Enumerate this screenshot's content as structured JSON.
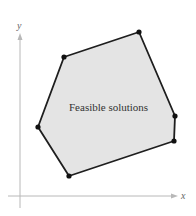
{
  "diagram": {
    "type": "feasible-region",
    "region_label": "Feasible solutions",
    "axes": {
      "x_label": "x",
      "y_label": "y"
    },
    "colors": {
      "fill": "#e4e4e4",
      "edge": "#1e1e1e",
      "vertex": "#111111",
      "axis": "#b8b8b8"
    },
    "vertices_px": [
      [
        64,
        57
      ],
      [
        139,
        32
      ],
      [
        175,
        116
      ],
      [
        174,
        141
      ],
      [
        69,
        176
      ],
      [
        38,
        127
      ]
    ]
  }
}
